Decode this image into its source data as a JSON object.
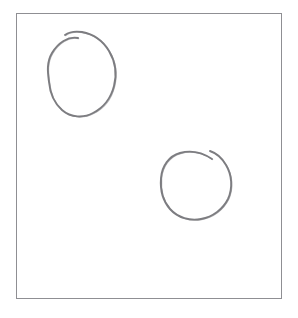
{
  "canvas": {
    "width": 298,
    "height": 318,
    "background_color": "#ffffff",
    "description": "Hand-drawn sketch canvas with two circles"
  },
  "frame": {
    "name": "drawing-frame",
    "x": 16,
    "y": 13,
    "width": 266,
    "height": 286,
    "border_color": "#8f8f93",
    "border_width": 1,
    "fill_color": "#ffffff"
  },
  "shapes": [
    {
      "id": "circle-1",
      "label": "hand-drawn circle top-left",
      "stroke_color": "#6b6b70",
      "stroke_width": 1.9,
      "center_x": 83,
      "center_y": 72,
      "radius_x": 33,
      "radius_y": 42,
      "gap_position": "top",
      "path": "M 78 38 C 68 36 58 43 52 53 C 46 63 48 74 49 82 C 50 93 54 103 62 110 C 71 118 84 118 93 113 C 103 108 111 98 114 86 C 117 74 115 61 109 51 C 103 41 93 34 82 32 C 75 31 69 32 65 35"
    },
    {
      "id": "circle-2",
      "label": "hand-drawn circle bottom-right",
      "stroke_color": "#6b6b70",
      "stroke_width": 1.9,
      "center_x": 196,
      "center_y": 186,
      "radius_x": 35,
      "radius_y": 34,
      "gap_position": "top-right",
      "path": "M 212 159 C 203 153 191 150 180 153 C 169 156 162 166 161 178 C 160 190 163 201 170 209 C 178 218 190 221 201 219 C 213 217 223 209 228 199 C 233 188 232 175 226 165 C 222 158 216 153 210 151"
    }
  ],
  "colors": {
    "page_background": "#ffffff",
    "frame_border": "#8f8f93",
    "sketch_stroke": "#6b6b70"
  }
}
